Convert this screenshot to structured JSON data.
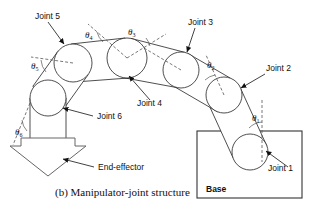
{
  "figure": {
    "caption": "(b) Manipulator-joint structure",
    "base_label": "Base",
    "end_effector_label": "End-effector"
  },
  "joints": [
    {
      "id": "joint-1",
      "label": "Joint 1",
      "cx": 250,
      "cy": 152,
      "r": 18,
      "label_x": 268,
      "label_y": 171
    },
    {
      "id": "joint-2",
      "label": "Joint 2",
      "cx": 224,
      "cy": 95,
      "r": 18,
      "label_x": 262,
      "label_y": 68
    },
    {
      "id": "joint-3",
      "label": "Joint 3",
      "cx": 181,
      "cy": 70,
      "r": 18,
      "label_x": 188,
      "label_y": 22
    },
    {
      "id": "joint-4",
      "label": "Joint 4",
      "cx": 127,
      "cy": 58,
      "r": 20,
      "label_x": 137,
      "label_y": 106
    },
    {
      "id": "joint-5",
      "label": "Joint 5",
      "cx": 73,
      "cy": 63,
      "r": 19,
      "label_x": 35,
      "label_y": 17
    },
    {
      "id": "joint-6",
      "label": "Joint 6",
      "cx": 48,
      "cy": 98,
      "r": 18,
      "label_x": 96,
      "label_y": 119
    }
  ],
  "angles": [
    {
      "id": "theta-1",
      "symbol": "θ",
      "subscript": "1",
      "x": 252,
      "y": 118
    },
    {
      "id": "theta-2",
      "symbol": "θ",
      "subscript": "2",
      "x": 209,
      "y": 65
    },
    {
      "id": "theta-3",
      "symbol": "θ",
      "subscript": "3",
      "x": 131,
      "y": 35
    },
    {
      "id": "theta-4",
      "symbol": "θ",
      "subscript": "4",
      "x": 88,
      "y": 38
    },
    {
      "id": "theta-5",
      "symbol": "θ",
      "subscript": "5",
      "x": 34,
      "y": 68
    },
    {
      "id": "theta-6",
      "symbol": "θ",
      "subscript": "6",
      "x": 17,
      "y": 134
    }
  ],
  "base_box": {
    "x": 197,
    "y": 131,
    "width": 105,
    "height": 67
  },
  "colors": {
    "stroke": "#222222",
    "dash": "#555555",
    "text": "#111111",
    "fill": "#ffffff"
  }
}
